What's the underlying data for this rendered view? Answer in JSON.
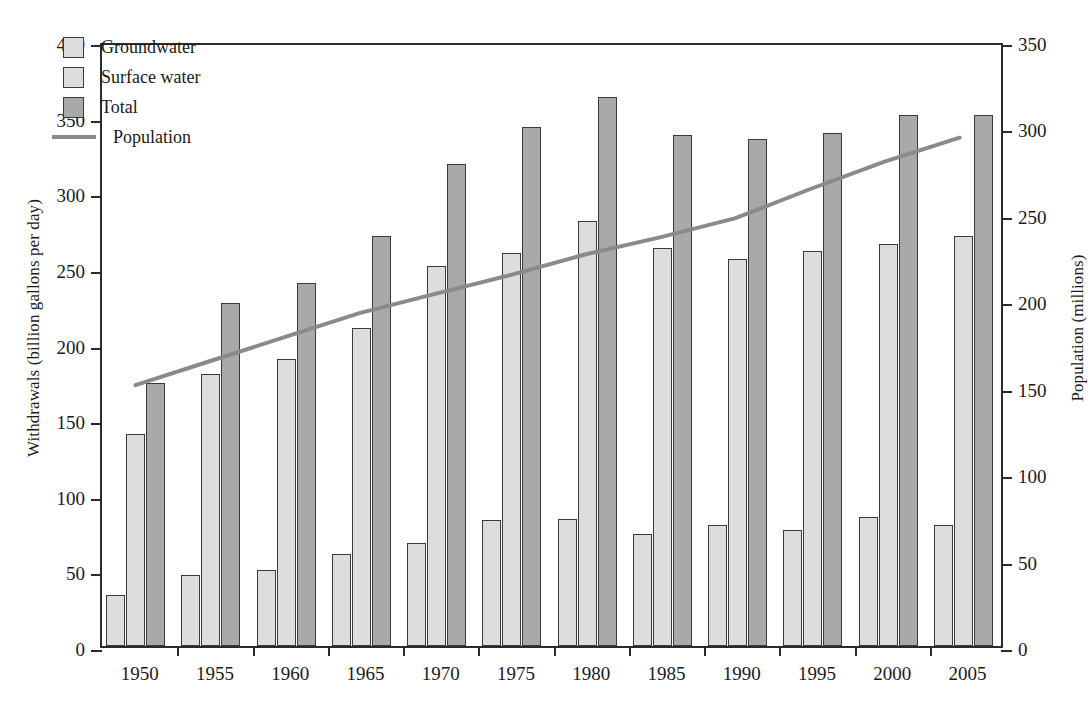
{
  "chart_data": {
    "type": "bar",
    "title": "",
    "xlabel": "",
    "ylabel": "Withdrawals (billion gallons per day)",
    "y2label": "Population (millions)",
    "categories": [
      "1950",
      "1955",
      "1960",
      "1965",
      "1970",
      "1975",
      "1980",
      "1985",
      "1990",
      "1995",
      "2000",
      "2005"
    ],
    "ylim": [
      0,
      400
    ],
    "y2lim": [
      0,
      350
    ],
    "yticks": [
      "0",
      "50",
      "100",
      "150",
      "200",
      "250",
      "300",
      "350",
      "400"
    ],
    "y2ticks": [
      "0",
      "50",
      "100",
      "150",
      "200",
      "250",
      "300",
      "350"
    ],
    "grid": false,
    "legend_position": "upper left",
    "series": [
      {
        "name": "Groundwater",
        "kind": "bar",
        "axis": "left",
        "color": "#dddddd",
        "values": [
          34,
          47,
          50,
          61,
          68,
          83,
          84,
          74,
          80,
          77,
          85,
          80
        ]
      },
      {
        "name": "Surface water",
        "kind": "bar",
        "axis": "left",
        "color": "#dddddd",
        "values": [
          140,
          180,
          190,
          210,
          251,
          260,
          281,
          263,
          256,
          261,
          266,
          271
        ]
      },
      {
        "name": "Total",
        "kind": "bar",
        "axis": "left",
        "color": "#a9a9a9",
        "values": [
          174,
          227,
          240,
          271,
          319,
          343,
          363,
          338,
          335,
          339,
          351,
          351
        ]
      },
      {
        "name": "Population",
        "kind": "line",
        "axis": "right",
        "color": "#8a8a8a",
        "values": [
          152,
          166,
          180,
          194,
          205,
          216,
          228,
          238,
          249,
          266,
          282,
          296
        ]
      }
    ]
  },
  "legend": {
    "items": [
      {
        "label": "Groundwater",
        "swatch": "groundwater"
      },
      {
        "label": "Surface water",
        "swatch": "surface"
      },
      {
        "label": "Total",
        "swatch": "total"
      },
      {
        "label": "Population",
        "swatch": "line"
      }
    ]
  }
}
